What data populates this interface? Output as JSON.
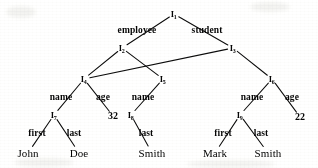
{
  "diagram": {
    "type": "tree",
    "stroke_color": "#111111",
    "background_color": "#fbfbfa",
    "width": 318,
    "height": 168,
    "nodes": [
      {
        "id": "I1",
        "label": "I",
        "subscript": "1",
        "kind": "internal",
        "x": 174,
        "y": 14
      },
      {
        "id": "I2",
        "label": "I",
        "subscript": "2",
        "kind": "internal",
        "x": 122,
        "y": 48
      },
      {
        "id": "I3",
        "label": "I",
        "subscript": "3",
        "kind": "internal",
        "x": 233,
        "y": 48
      },
      {
        "id": "I4",
        "label": "I",
        "subscript": "4",
        "kind": "internal",
        "x": 84,
        "y": 79
      },
      {
        "id": "I5",
        "label": "I",
        "subscript": "5",
        "kind": "internal",
        "x": 163,
        "y": 79
      },
      {
        "id": "I6",
        "label": "I",
        "subscript": "6",
        "kind": "internal",
        "x": 272,
        "y": 79
      },
      {
        "id": "I7",
        "label": "I",
        "subscript": "7",
        "kind": "internal",
        "x": 54,
        "y": 115
      },
      {
        "id": "I8",
        "label": "I",
        "subscript": "8",
        "kind": "internal",
        "x": 131,
        "y": 115
      },
      {
        "id": "I9",
        "label": "I",
        "subscript": "9",
        "kind": "internal",
        "x": 240,
        "y": 115
      },
      {
        "id": "V32",
        "label": "32",
        "kind": "value",
        "x": 113,
        "y": 116
      },
      {
        "id": "V22",
        "label": "22",
        "kind": "value",
        "x": 300,
        "y": 117
      },
      {
        "id": "VJohn",
        "label": "John",
        "kind": "leaf",
        "x": 28,
        "y": 153
      },
      {
        "id": "VDoe",
        "label": "Doe",
        "kind": "leaf",
        "x": 79,
        "y": 153
      },
      {
        "id": "VSmith1",
        "label": "Smith",
        "kind": "leaf",
        "x": 152,
        "y": 153
      },
      {
        "id": "VMark",
        "label": "Mark",
        "kind": "leaf",
        "x": 215,
        "y": 153
      },
      {
        "id": "VSmith2",
        "label": "Smith",
        "kind": "leaf",
        "x": 268,
        "y": 153
      }
    ],
    "edges": [
      {
        "from": "I1",
        "to": "I2",
        "label": "employee",
        "label_x": 137,
        "label_y": 31
      },
      {
        "from": "I1",
        "to": "I3",
        "label": "student",
        "label_x": 207,
        "label_y": 31
      },
      {
        "from": "I2",
        "to": "I4",
        "label": "",
        "label_x": 0,
        "label_y": 0
      },
      {
        "from": "I2",
        "to": "I5",
        "label": "",
        "label_x": 0,
        "label_y": 0
      },
      {
        "from": "I3",
        "to": "I4",
        "label": "",
        "label_x": 0,
        "label_y": 0
      },
      {
        "from": "I3",
        "to": "I6",
        "label": "",
        "label_x": 0,
        "label_y": 0
      },
      {
        "from": "I4",
        "to": "I7",
        "label": "name",
        "label_x": 61,
        "label_y": 98
      },
      {
        "from": "I4",
        "to": "V32",
        "label": "age",
        "label_x": 103,
        "label_y": 98
      },
      {
        "from": "I5",
        "to": "I8",
        "label": "name",
        "label_x": 143,
        "label_y": 98
      },
      {
        "from": "I6",
        "to": "I9",
        "label": "name",
        "label_x": 252,
        "label_y": 98
      },
      {
        "from": "I6",
        "to": "V22",
        "label": "age",
        "label_x": 292,
        "label_y": 98
      },
      {
        "from": "I7",
        "to": "VJohn",
        "label": "first",
        "label_x": 37,
        "label_y": 134
      },
      {
        "from": "I7",
        "to": "VDoe",
        "label": "last",
        "label_x": 74,
        "label_y": 134
      },
      {
        "from": "I8",
        "to": "VSmith1",
        "label": "last",
        "label_x": 146,
        "label_y": 134
      },
      {
        "from": "I9",
        "to": "VMark",
        "label": "first",
        "label_x": 223,
        "label_y": 134
      },
      {
        "from": "I9",
        "to": "VSmith2",
        "label": "last",
        "label_x": 261,
        "label_y": 134
      }
    ]
  }
}
